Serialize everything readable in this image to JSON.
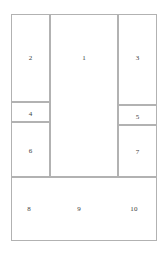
{
  "diagram": {
    "canvas": {
      "width": 167,
      "height": 255,
      "background": "#ffffff"
    },
    "style": {
      "line_color": "#b2b2b2",
      "line_width": 1,
      "text_color": "#3c3c3c",
      "label_font_size": 7
    },
    "bounds": {
      "left": 11,
      "top": 14,
      "right": 157,
      "bottom": 241
    },
    "columns": [
      {
        "name": "left-column",
        "x": 11,
        "width": 39
      },
      {
        "name": "middle-column",
        "x": 50,
        "width": 68
      },
      {
        "name": "right-column",
        "x": 118,
        "width": 39
      }
    ],
    "regions": [
      {
        "id": "region-1",
        "label": "1",
        "column": "middle-column",
        "x": 50,
        "y": 14,
        "width": 68,
        "height": 163,
        "label_y": 40
      },
      {
        "id": "region-2",
        "label": "2",
        "column": "left-column",
        "x": 11,
        "y": 14,
        "width": 39,
        "height": 88,
        "label_y": 40
      },
      {
        "id": "region-3",
        "label": "3",
        "column": "right-column",
        "x": 118,
        "y": 14,
        "width": 39,
        "height": 91,
        "label_y": 40
      },
      {
        "id": "region-4",
        "label": "4",
        "column": "left-column",
        "x": 11,
        "y": 102,
        "width": 39,
        "height": 20,
        "label_y": 8
      },
      {
        "id": "region-5",
        "label": "5",
        "column": "right-column",
        "x": 118,
        "y": 105,
        "width": 39,
        "height": 20,
        "label_y": 8
      },
      {
        "id": "region-6",
        "label": "6",
        "column": "left-column",
        "x": 11,
        "y": 122,
        "width": 39,
        "height": 55,
        "label_y": 25
      },
      {
        "id": "region-7",
        "label": "7",
        "column": "right-column",
        "x": 118,
        "y": 125,
        "width": 39,
        "height": 52,
        "label_y": 23
      }
    ],
    "bottom_band": {
      "id": "region-bottom-band",
      "name": "bottom-band",
      "x": 11,
      "y": 177,
      "width": 146,
      "height": 64,
      "labels": [
        {
          "id": "region-8",
          "label": "8",
          "x": 28,
          "y": 208
        },
        {
          "id": "region-9",
          "label": "9",
          "x": 78,
          "y": 208
        },
        {
          "id": "region-10",
          "label": "10",
          "x": 133,
          "y": 208
        }
      ]
    }
  }
}
